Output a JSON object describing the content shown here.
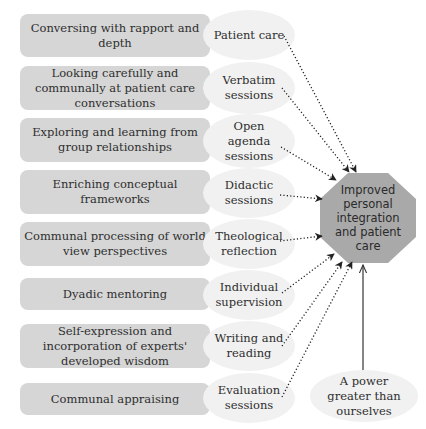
{
  "diagram": {
    "center": {
      "label": "Improved personal integration and patient care",
      "fill": "#a9a9a9"
    },
    "rows": [
      {
        "outcome": "Conversing with rapport and depth",
        "activity": "Patient care"
      },
      {
        "outcome": "Looking carefully and communally at patient care conversations",
        "activity": "Verbatim sessions"
      },
      {
        "outcome": "Exploring and learning from group relationships",
        "activity": "Open agenda sessions"
      },
      {
        "outcome": "Enriching conceptual frameworks",
        "activity": "Didactic sessions"
      },
      {
        "outcome": "Communal processing of world view perspectives",
        "activity": "Theological reflection"
      },
      {
        "outcome": "Dyadic mentoring",
        "activity": "Individual supervision"
      },
      {
        "outcome": "Self-expression and incorporation of experts' developed wisdom",
        "activity": "Writing and reading"
      },
      {
        "outcome": "Communal appraising",
        "activity": "Evaluation sessions"
      }
    ],
    "external": {
      "label": "A power greater than ourselves"
    },
    "colors": {
      "box": "#d6d6d6",
      "oval": "#f1f1f1",
      "octagon": "#a9a9a9",
      "arrow": "#222222"
    }
  }
}
